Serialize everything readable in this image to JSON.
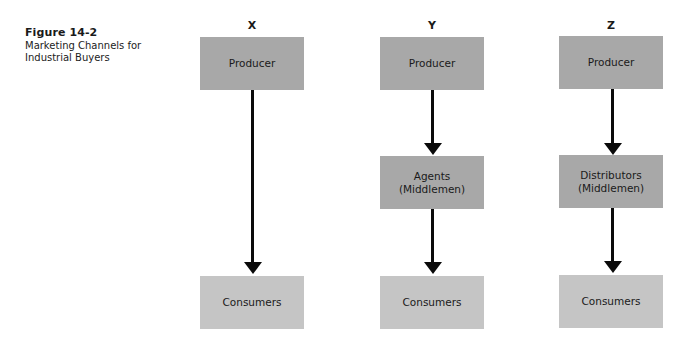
{
  "caption": {
    "title": "Figure 14-2",
    "text": "Marketing Channels for Industrial Buyers"
  },
  "columns": [
    {
      "label": "X",
      "top": "Producer",
      "middle": null,
      "bottom": "Consumers"
    },
    {
      "label": "Y",
      "top": "Producer",
      "middle": "Agents (Middlemen)",
      "bottom": "Consumers"
    },
    {
      "label": "Z",
      "top": "Producer",
      "middle": "Distributors (Middlemen)",
      "bottom": "Consumers"
    }
  ],
  "colors": {
    "dark_box": "#a8a8a8",
    "light_box": "#c5c5c5",
    "arrow": "#0a0a0a"
  }
}
